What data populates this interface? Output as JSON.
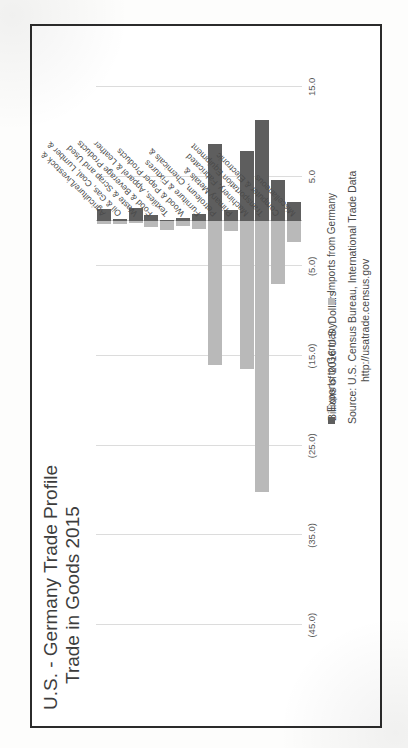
{
  "figure": {
    "title_line1": "U.S. - Germany Trade Profile",
    "title_line2": "Trade in Goods 2015",
    "axis_title": "Billions of 2016 U.S. Dollars",
    "source_line1": "Source: U.S. Census Bureau, International Trade Data",
    "source_line2": "http://usatrade.census.gov"
  },
  "legend": {
    "exports_label": "Exports to Germany",
    "imports_label": "Imports from Germany",
    "exports_color": "#5e5e5e",
    "imports_color": "#b9b9b9"
  },
  "chart_data": {
    "type": "bar",
    "orientation": "horizontal",
    "xlabel": "Billions of 2016 U.S. Dollars",
    "ylabel": "",
    "xlim": [
      -50,
      20
    ],
    "grid": true,
    "legend_position": "bottom-right",
    "tick_labels": [
      "15.0",
      "5.0",
      "(5.0)",
      "(15.0)",
      "(25.0)",
      "(35.0)",
      "(45.0)"
    ],
    "tick_values": [
      15,
      5,
      -5,
      -15,
      -25,
      -35,
      -45
    ],
    "categories": [
      "Agriculture/Livestock &",
      "Oil & Gas, Coal, Lumber &",
      "Waste & Scrap and Used",
      "Food & Beverage Products",
      "Textiles, Apparel & Leather",
      "Wood & Paper Products",
      "Furniture & Fixtures",
      "Petroleum, Chemicals &",
      "Primary Metals &",
      "Machinery, Fabricated",
      "Transportation Equipment",
      "Computer & Electronic",
      "Miscellaneous"
    ],
    "series": [
      {
        "name": "Exports to Germany",
        "color": "#5e5e5e",
        "values": [
          1.4,
          0.3,
          1.5,
          0.7,
          0.2,
          0.4,
          0.8,
          8.6,
          1.3,
          7.8,
          11.3,
          4.6,
          2.2
        ]
      },
      {
        "name": "Imports from Germany",
        "color": "#b9b9b9",
        "values": [
          -0.3,
          -0.3,
          -0.2,
          -0.6,
          -1.0,
          -0.5,
          -0.8,
          -16.0,
          -1.1,
          -16.5,
          -30.2,
          -7.0,
          -2.3
        ]
      }
    ]
  }
}
